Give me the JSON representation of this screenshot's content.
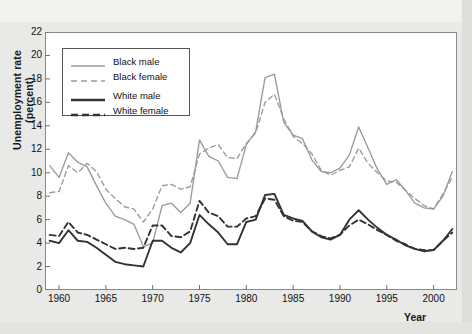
{
  "chart_data": {
    "type": "line",
    "title": "",
    "xlabel": "Year",
    "ylabel": "Unemployment rate (percent)",
    "ylabel_line1": "Unemployment rate",
    "ylabel_line2": "(percent)",
    "xlim": [
      1958.5,
      2002.5
    ],
    "ylim": [
      0,
      22
    ],
    "ytick_step": 2,
    "yticks": [
      0,
      2,
      4,
      6,
      8,
      10,
      12,
      14,
      16,
      18,
      20,
      22
    ],
    "xticks": [
      1960,
      1965,
      1970,
      1975,
      1980,
      1985,
      1990,
      1995,
      2000
    ],
    "grid": false,
    "legend_position": "top-left",
    "x": [
      1959,
      1960,
      1961,
      1962,
      1963,
      1964,
      1965,
      1966,
      1967,
      1968,
      1969,
      1970,
      1971,
      1972,
      1973,
      1974,
      1975,
      1976,
      1977,
      1978,
      1979,
      1980,
      1981,
      1982,
      1983,
      1984,
      1985,
      1986,
      1987,
      1988,
      1989,
      1990,
      1991,
      1992,
      1993,
      1994,
      1995,
      1996,
      1997,
      1998,
      1999,
      2000,
      2001,
      2002
    ],
    "series": [
      {
        "name": "Black male",
        "color": "#9a9a9a",
        "style": "solid",
        "values": [
          10.6,
          9.6,
          11.7,
          10.9,
          10.5,
          8.9,
          7.4,
          6.3,
          6.0,
          5.6,
          3.7,
          4.0,
          7.2,
          7.4,
          6.6,
          7.4,
          12.8,
          11.4,
          11.0,
          9.6,
          9.5,
          12.4,
          13.5,
          18.1,
          18.4,
          14.3,
          13.2,
          12.9,
          11.1,
          10.1,
          10.0,
          10.4,
          11.5,
          13.9,
          12.1,
          10.3,
          9.0,
          9.4,
          8.5,
          7.4,
          7.0,
          6.9,
          8.0,
          10.1
        ]
      },
      {
        "name": "Black female",
        "color": "#9a9a9a",
        "style": "dashed",
        "values": [
          8.3,
          8.4,
          10.6,
          10.0,
          10.8,
          10.1,
          8.6,
          7.8,
          7.1,
          6.9,
          5.8,
          6.9,
          8.9,
          9.0,
          8.6,
          8.8,
          11.6,
          12.1,
          12.4,
          11.3,
          11.2,
          12.5,
          13.4,
          16.0,
          16.7,
          14.6,
          13.1,
          12.5,
          11.6,
          10.2,
          9.8,
          10.2,
          10.5,
          12.1,
          10.8,
          10.0,
          9.3,
          9.2,
          8.5,
          7.8,
          7.2,
          6.9,
          8.2,
          9.6
        ]
      },
      {
        "name": "White male",
        "color": "#333333",
        "style": "solid",
        "values": [
          4.2,
          4.0,
          5.1,
          4.2,
          4.1,
          3.6,
          3.0,
          2.4,
          2.2,
          2.1,
          2.0,
          4.2,
          4.2,
          3.6,
          3.2,
          4.0,
          6.4,
          5.6,
          4.9,
          3.9,
          3.9,
          5.8,
          6.0,
          8.1,
          8.2,
          6.4,
          6.1,
          5.9,
          5.0,
          4.5,
          4.3,
          4.7,
          6.0,
          6.8,
          6.0,
          5.3,
          4.7,
          4.3,
          3.8,
          3.5,
          3.3,
          3.4,
          4.2,
          5.2
        ]
      },
      {
        "name": "White female",
        "color": "#333333",
        "style": "dashed",
        "values": [
          4.7,
          4.6,
          5.8,
          4.9,
          4.7,
          4.3,
          3.9,
          3.5,
          3.6,
          3.5,
          3.6,
          5.5,
          5.5,
          4.6,
          4.5,
          5.0,
          7.6,
          6.6,
          6.3,
          5.4,
          5.4,
          6.1,
          6.3,
          7.8,
          7.7,
          6.3,
          5.9,
          5.8,
          5.0,
          4.6,
          4.4,
          4.7,
          5.5,
          6.0,
          5.6,
          5.1,
          4.7,
          4.2,
          3.9,
          3.5,
          3.4,
          3.4,
          4.2,
          4.9
        ]
      }
    ]
  },
  "legend": {
    "items": [
      {
        "label": "Black male",
        "color": "#9a9a9a",
        "style": "solid",
        "weight": "thin"
      },
      {
        "label": "Black female",
        "color": "#9a9a9a",
        "style": "dashed",
        "weight": "thin"
      },
      {
        "label": "White male",
        "color": "#333333",
        "style": "solid",
        "weight": "thick"
      },
      {
        "label": "White female",
        "color": "#333333",
        "style": "dashed",
        "weight": "thick"
      }
    ]
  }
}
